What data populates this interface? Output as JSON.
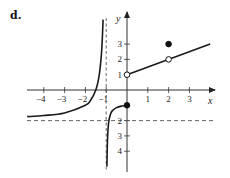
{
  "panel": {
    "label": "d."
  },
  "chart_data": {
    "type": "line",
    "title": "",
    "xlabel": "x",
    "ylabel": "y",
    "xlim": [
      -4.8,
      4.0
    ],
    "ylim": [
      -5.0,
      4.7
    ],
    "grid": false,
    "x_ticks": [
      -4,
      -3,
      -2,
      -1,
      1,
      2,
      3
    ],
    "x_tick_labels": [
      "−4",
      "−3",
      "−2",
      "−1",
      "1",
      "2",
      "3"
    ],
    "y_ticks": [
      3,
      2,
      1,
      -1,
      -2,
      -3,
      -4
    ],
    "y_tick_labels": [
      "3",
      "2",
      "1",
      "−1",
      "2",
      "3",
      "4"
    ],
    "asymptotes": [
      {
        "type": "vertical",
        "x": -1,
        "style": "dashed"
      },
      {
        "type": "horizontal",
        "y": -2,
        "style": "dashed"
      }
    ],
    "series": [
      {
        "name": "left branch (x < -1)",
        "description": "approaches y=-2 as x→-∞, rises to +∞ as x→-1⁻",
        "points": [
          [
            -4.8,
            -1.74
          ],
          [
            -4,
            -1.67
          ],
          [
            -3,
            -1.5
          ],
          [
            -2,
            -1.0
          ],
          [
            -1.75,
            -0.67
          ],
          [
            -1.5,
            0
          ],
          [
            -1.35,
            0.86
          ],
          [
            -1.25,
            2.0
          ],
          [
            -1.2,
            3.0
          ],
          [
            -1.17,
            3.9
          ],
          [
            -1.15,
            4.6
          ]
        ]
      },
      {
        "name": "middle branch (-1 < x ≤ 0)",
        "description": "rises from -∞ near x=-1⁺ to (0,-1)",
        "points": [
          [
            -0.965,
            -5.0
          ],
          [
            -0.95,
            -3.85
          ],
          [
            -0.92,
            -2.73
          ],
          [
            -0.88,
            -2.1
          ],
          [
            -0.8,
            -1.6
          ],
          [
            -0.7,
            -1.35
          ],
          [
            -0.5,
            -1.15
          ],
          [
            -0.25,
            -1.05
          ],
          [
            0,
            -1
          ]
        ]
      },
      {
        "name": "right branch (x > 0)",
        "description": "line from (0,1) open to beyond x=3",
        "points": [
          [
            0,
            1
          ],
          [
            2,
            2
          ],
          [
            4,
            3
          ]
        ]
      }
    ],
    "special_points": [
      {
        "x": 0,
        "y": -1,
        "filled": true
      },
      {
        "x": 0,
        "y": 1,
        "filled": false
      },
      {
        "x": 2,
        "y": 2,
        "filled": false
      },
      {
        "x": 2,
        "y": 3,
        "filled": true
      }
    ],
    "pixel_map": {
      "origin_x": 127,
      "origin_y": 90,
      "px_per_unit_x": 20.8,
      "px_per_unit_y": 15.3
    }
  }
}
